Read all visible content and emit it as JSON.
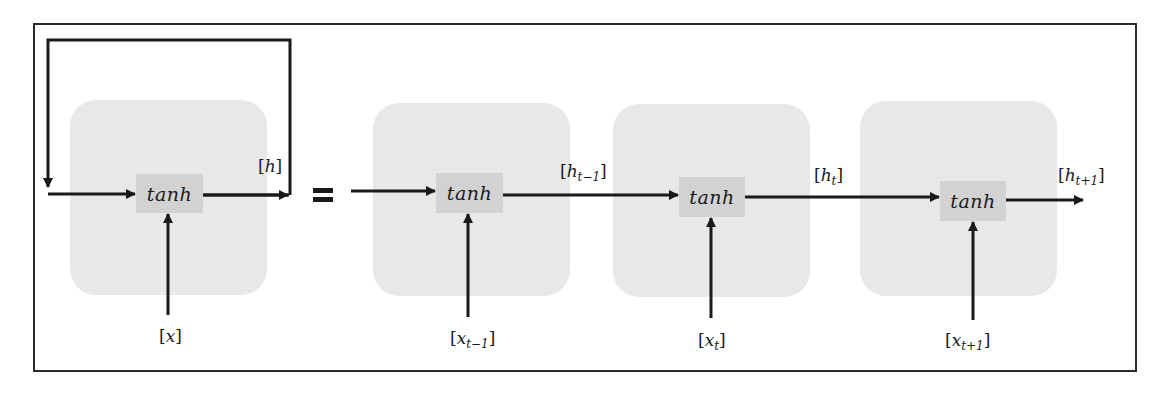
{
  "diagram": {
    "equals_symbol": "=",
    "colors": {
      "frame": "#2a2a2a",
      "cell_background": "#e8e8e8",
      "activation_box": "#d2d2d2",
      "arrow": "#1a1a1a",
      "text": "#1a1a1a"
    },
    "folded": {
      "activation": "tanh",
      "input_label": {
        "var": "x",
        "sub": ""
      },
      "output_label": {
        "var": "h",
        "sub": ""
      },
      "has_feedback_loop": true
    },
    "unrolled": [
      {
        "activation": "tanh",
        "input_label": {
          "var": "x",
          "sub": "t−1"
        },
        "output_label": {
          "var": "h",
          "sub": "t−1"
        }
      },
      {
        "activation": "tanh",
        "input_label": {
          "var": "x",
          "sub": "t"
        },
        "output_label": {
          "var": "h",
          "sub": "t"
        }
      },
      {
        "activation": "tanh",
        "input_label": {
          "var": "x",
          "sub": "t+1"
        },
        "output_label": {
          "var": "h",
          "sub": "t+1"
        }
      }
    ]
  }
}
